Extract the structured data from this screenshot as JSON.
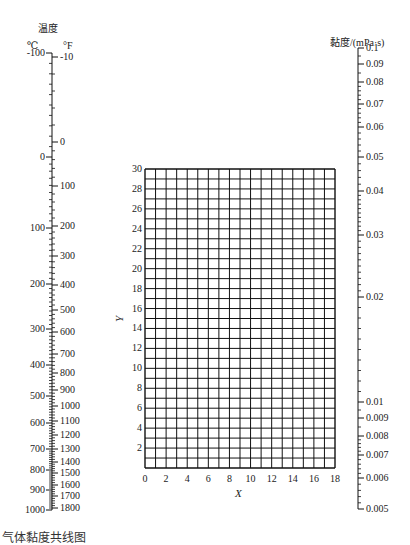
{
  "chart_data": {
    "type": "nomogram",
    "temperature_scale": {
      "title": "温度",
      "celsius_unit": "℃",
      "fahrenheit_unit": "°F",
      "celsius_ticks": [
        {
          "label": "-100",
          "y": 53
        },
        {
          "label": "0",
          "y": 157
        },
        {
          "label": "100",
          "y": 228
        },
        {
          "label": "200",
          "y": 284
        },
        {
          "label": "300",
          "y": 329
        },
        {
          "label": "400",
          "y": 365
        },
        {
          "label": "500",
          "y": 396
        },
        {
          "label": "600",
          "y": 423
        },
        {
          "label": "700",
          "y": 449
        },
        {
          "label": "800",
          "y": 470
        },
        {
          "label": "900",
          "y": 490
        },
        {
          "label": "1000",
          "y": 510
        }
      ],
      "fahrenheit_ticks": [
        {
          "label": "-10",
          "y": 57
        },
        {
          "label": "0",
          "y": 142
        },
        {
          "label": "100",
          "y": 186
        },
        {
          "label": "200",
          "y": 226
        },
        {
          "label": "300",
          "y": 256
        },
        {
          "label": "400",
          "y": 285
        },
        {
          "label": "500",
          "y": 310
        },
        {
          "label": "600",
          "y": 332
        },
        {
          "label": "700",
          "y": 354
        },
        {
          "label": "800",
          "y": 373
        },
        {
          "label": "900",
          "y": 390
        },
        {
          "label": "1000",
          "y": 406
        },
        {
          "label": "1100",
          "y": 421
        },
        {
          "label": "1200",
          "y": 435
        },
        {
          "label": "1300",
          "y": 449
        },
        {
          "label": "1400",
          "y": 462
        },
        {
          "label": "1500",
          "y": 473
        },
        {
          "label": "1600",
          "y": 485
        },
        {
          "label": "1700",
          "y": 496
        },
        {
          "label": "1800",
          "y": 508
        }
      ]
    },
    "grid": {
      "xlabel": "X",
      "ylabel": "Y",
      "xlim": [
        0,
        18
      ],
      "ylim": [
        0,
        30
      ],
      "grid": true,
      "x_ticks": [
        "0",
        "2",
        "4",
        "6",
        "8",
        "10",
        "12",
        "14",
        "16",
        "18"
      ],
      "y_ticks": [
        "2",
        "4",
        "6",
        "8",
        "10",
        "12",
        "14",
        "16",
        "18",
        "20",
        "22",
        "24",
        "26",
        "28",
        "30"
      ]
    },
    "viscosity_scale": {
      "title": "黏度/(mPa·s)",
      "scale": "log",
      "range": [
        0.005,
        0.1
      ],
      "ticks": [
        {
          "label": "0.1",
          "y": 48
        },
        {
          "label": "0.09",
          "y": 64
        },
        {
          "label": "0.08",
          "y": 82
        },
        {
          "label": "0.07",
          "y": 104
        },
        {
          "label": "0.06",
          "y": 127
        },
        {
          "label": "0.05",
          "y": 157
        },
        {
          "label": "0.04",
          "y": 191
        },
        {
          "label": "0.03",
          "y": 235
        },
        {
          "label": "0.02",
          "y": 297
        },
        {
          "label": "0.01",
          "y": 402
        },
        {
          "label": "0.009",
          "y": 418
        },
        {
          "label": "0.008",
          "y": 436
        },
        {
          "label": "0.007",
          "y": 455
        },
        {
          "label": "0.006",
          "y": 478
        },
        {
          "label": "0.005",
          "y": 509
        }
      ]
    }
  },
  "caption": "气体黏度共线图"
}
